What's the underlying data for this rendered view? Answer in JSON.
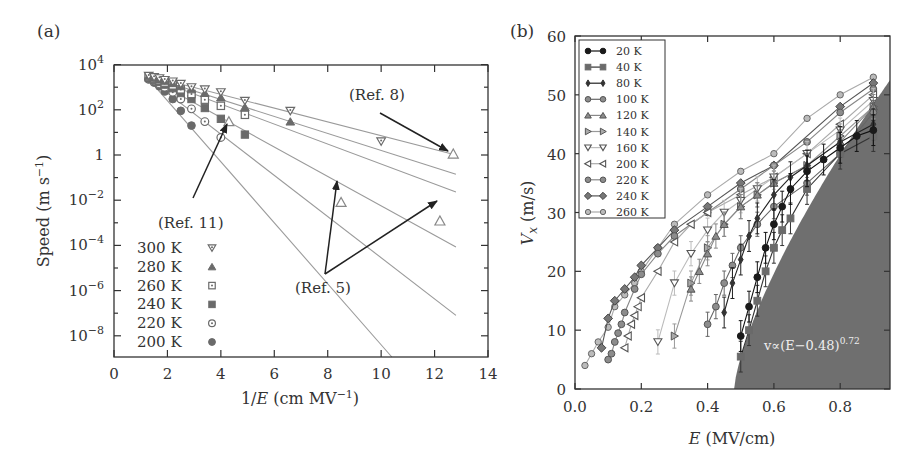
{
  "chart_data": [
    {
      "panel": "(a)",
      "type": "scatter",
      "title": "",
      "xlabel": "1/E (cm MV⁻¹)",
      "ylabel": "Speed (m s⁻¹)",
      "xlim": [
        0,
        14
      ],
      "ylim_log10": [
        -9.3,
        4
      ],
      "yscale": "log",
      "xticks": [
        0,
        2,
        4,
        6,
        8,
        10,
        12,
        14
      ],
      "yticks": [
        "10^4",
        "10^2",
        "1",
        "10^-2",
        "10^-4",
        "10^-6",
        "10^-8"
      ],
      "legend_position": "lower-left",
      "grid": false,
      "series": [
        {
          "name": "300 K",
          "marker": "triangle-down-open-dot",
          "x": [
            1.3,
            1.5,
            1.7,
            1.9,
            2.2,
            2.5,
            2.9,
            3.4,
            4.0,
            4.9,
            6.6,
            10.0
          ],
          "y": [
            3200,
            2800,
            2500,
            2100,
            1800,
            1400,
            1000,
            800,
            600,
            250,
            90,
            4
          ],
          "fit_end": [
            12.8,
            1.0
          ]
        },
        {
          "name": "280 K",
          "marker": "triangle-up-filled",
          "x": [
            1.3,
            1.5,
            1.7,
            1.9,
            2.2,
            2.5,
            2.9,
            3.4,
            4.0,
            4.9,
            6.6
          ],
          "y": [
            3000,
            2600,
            2200,
            1900,
            1500,
            1100,
            800,
            550,
            350,
            130,
            30
          ],
          "fit_end": [
            12.8,
            0.14
          ]
        },
        {
          "name": "260 K",
          "marker": "square-open-dot",
          "x": [
            1.3,
            1.5,
            1.7,
            1.9,
            2.2,
            2.5,
            2.9,
            3.4,
            4.0,
            4.9
          ],
          "y": [
            2800,
            2400,
            2000,
            1600,
            1200,
            800,
            500,
            280,
            150,
            60
          ],
          "fit_end": [
            12.8,
            0.023
          ]
        },
        {
          "name": "240 K",
          "marker": "square-filled",
          "x": [
            1.3,
            1.5,
            1.7,
            1.9,
            2.2,
            2.5,
            2.9,
            3.4,
            4.0,
            4.9
          ],
          "y": [
            2600,
            2100,
            1700,
            1300,
            900,
            550,
            300,
            120,
            40,
            8
          ],
          "fit_end": [
            12.8,
            8.5e-05
          ]
        },
        {
          "name": "220 K",
          "marker": "circle-open-dot",
          "x": [
            1.3,
            1.5,
            1.7,
            1.9,
            2.2,
            2.5,
            2.9,
            3.4,
            4.0
          ],
          "y": [
            2400,
            1900,
            1400,
            1000,
            600,
            300,
            110,
            30,
            6
          ],
          "fit_end": [
            12.8,
            8e-08
          ]
        },
        {
          "name": "200 K",
          "marker": "circle-filled",
          "x": [
            1.3,
            1.5,
            1.7,
            1.9,
            2.2,
            2.5,
            2.9
          ],
          "y": [
            2200,
            1600,
            1100,
            650,
            300,
            90,
            20
          ],
          "fit_end": [
            10.4,
            1.1e-09
          ]
        }
      ],
      "reference_points": [
        {
          "ref": "(Ref. 11)",
          "x": 4.3,
          "y": 30
        },
        {
          "ref": "(Ref. 5)",
          "x": 8.5,
          "y": 0.008
        },
        {
          "ref": "(Ref. 5)",
          "x": 12.2,
          "y": 0.0012
        },
        {
          "ref": "(Ref. 8)",
          "x": 12.7,
          "y": 1.1
        }
      ],
      "annotations": [
        "(Ref. 8)",
        "(Ref. 11)",
        "(Ref. 5)"
      ]
    },
    {
      "panel": "(b)",
      "type": "line",
      "title": "",
      "xlabel": "E (MV/cm)",
      "ylabel": "V_x (m/s)",
      "xlim": [
        0.0,
        0.95
      ],
      "ylim": [
        0,
        60
      ],
      "xticks": [
        0.0,
        0.2,
        0.4,
        0.6,
        0.8
      ],
      "yticks": [
        0,
        10,
        20,
        30,
        40,
        50,
        60
      ],
      "legend_position": "upper-left",
      "grid": false,
      "shaded_region": {
        "label": "v∝(E−0.48)^0.72",
        "E0": 0.48,
        "exponent": 0.72,
        "top_at_xmax": 52.5
      },
      "series": [
        {
          "name": "20 K",
          "marker": "circle-filled-black",
          "x": [
            0.5,
            0.525,
            0.55,
            0.575,
            0.6,
            0.625,
            0.65,
            0.7,
            0.75,
            0.8,
            0.85,
            0.9
          ],
          "y": [
            9,
            14,
            19,
            24,
            28,
            31,
            34,
            37,
            39,
            41,
            43,
            44
          ]
        },
        {
          "name": "40 K",
          "marker": "square-filled",
          "x": [
            0.5,
            0.525,
            0.55,
            0.575,
            0.6,
            0.625,
            0.65,
            0.7,
            0.8,
            0.9
          ],
          "y": [
            5.5,
            10,
            15,
            20,
            24,
            27,
            29,
            34,
            40,
            43
          ]
        },
        {
          "name": "80 K",
          "marker": "diamond-filled",
          "x": [
            0.45,
            0.475,
            0.5,
            0.525,
            0.55,
            0.6,
            0.65,
            0.7,
            0.8,
            0.9
          ],
          "y": [
            13,
            18,
            22,
            26,
            29,
            33,
            36,
            38,
            42,
            45
          ]
        },
        {
          "name": "100 K",
          "marker": "circle-grey",
          "x": [
            0.4,
            0.425,
            0.45,
            0.475,
            0.5,
            0.55,
            0.6,
            0.7,
            0.8,
            0.9
          ],
          "y": [
            11,
            14,
            18,
            21,
            24,
            28,
            31,
            35,
            40,
            47
          ]
        },
        {
          "name": "120 K",
          "marker": "triangle-up-grey",
          "x": [
            0.35,
            0.375,
            0.4,
            0.425,
            0.45,
            0.5,
            0.55,
            0.6,
            0.7,
            0.8,
            0.9
          ],
          "y": [
            17,
            20,
            23,
            26,
            28,
            31,
            33,
            35,
            38,
            42,
            48
          ]
        },
        {
          "name": "140 K",
          "marker": "triangle-right-grey",
          "x": [
            0.3,
            0.35,
            0.4,
            0.45,
            0.5,
            0.55,
            0.6,
            0.7,
            0.8,
            0.9
          ],
          "y": [
            9,
            18,
            24,
            28,
            31,
            33,
            35,
            38,
            43,
            48
          ]
        },
        {
          "name": "160 K",
          "marker": "triangle-down-open",
          "x": [
            0.25,
            0.3,
            0.35,
            0.4,
            0.45,
            0.5,
            0.55,
            0.6,
            0.7,
            0.8,
            0.9
          ],
          "y": [
            8,
            18,
            23,
            27,
            30,
            32,
            34,
            36,
            40,
            44,
            49
          ]
        },
        {
          "name": "200 K",
          "marker": "triangle-left-open",
          "x": [
            0.15,
            0.16,
            0.17,
            0.18,
            0.19,
            0.2,
            0.25,
            0.3,
            0.35,
            0.4,
            0.5,
            0.6,
            0.7,
            0.8,
            0.9
          ],
          "y": [
            7,
            9,
            11,
            12.5,
            14,
            15.5,
            20,
            25,
            28,
            30,
            33,
            36,
            40,
            45,
            50
          ]
        },
        {
          "name": "220 K",
          "marker": "circle-grey-2",
          "x": [
            0.1,
            0.11,
            0.12,
            0.13,
            0.14,
            0.15,
            0.18,
            0.2,
            0.25,
            0.3,
            0.4,
            0.5,
            0.6,
            0.7,
            0.8,
            0.9
          ],
          "y": [
            5,
            6,
            8,
            9.5,
            11,
            13,
            17,
            19.5,
            23,
            26,
            30,
            34,
            38,
            42,
            47,
            51
          ]
        },
        {
          "name": "240 K",
          "marker": "diamond-grey",
          "x": [
            0.08,
            0.1,
            0.12,
            0.15,
            0.18,
            0.2,
            0.25,
            0.3,
            0.4,
            0.5,
            0.6,
            0.8,
            0.9
          ],
          "y": [
            7,
            12,
            15,
            17,
            19,
            21,
            24,
            27,
            31,
            35,
            38,
            48,
            52
          ]
        },
        {
          "name": "260 K",
          "marker": "circle-open-small",
          "x": [
            0.03,
            0.05,
            0.07,
            0.1,
            0.12,
            0.15,
            0.18,
            0.2,
            0.25,
            0.3,
            0.4,
            0.5,
            0.6,
            0.7,
            0.8,
            0.9
          ],
          "y": [
            4,
            6,
            8,
            10.5,
            14,
            16,
            18,
            20,
            24,
            28,
            33,
            37,
            40,
            46,
            50,
            53
          ]
        }
      ]
    }
  ],
  "panel_a": {
    "label": "(a)",
    "xlabel_prefix": "1/",
    "xlabel_var": "E",
    "xlabel_suffix": " (cm MV",
    "xlabel_sup": "−1",
    "xlabel_close": ")",
    "ylabel": "Speed (m s",
    "ylabel_sup": "−1",
    "ylabel_close": ")",
    "xtick_labels": [
      "0",
      "2",
      "4",
      "6",
      "8",
      "10",
      "12",
      "14"
    ],
    "ytick_labels": [
      {
        "base": "10",
        "exp": "4"
      },
      {
        "base": "10",
        "exp": "2"
      },
      {
        "base": "1",
        "exp": ""
      },
      {
        "base": "10",
        "exp": "−2"
      },
      {
        "base": "10",
        "exp": "−4"
      },
      {
        "base": "10",
        "exp": "−6"
      },
      {
        "base": "10",
        "exp": "−8"
      }
    ],
    "legend": [
      "300 K",
      "280 K",
      "260 K",
      "240 K",
      "220 K",
      "200 K"
    ],
    "annotations": {
      "ref8": "(Ref. 8)",
      "ref11": "(Ref. 11)",
      "ref5": "(Ref. 5)"
    }
  },
  "panel_b": {
    "label": "(b)",
    "xlabel_var": "E",
    "xlabel_suffix": " (MV/cm)",
    "ylabel_var": "V",
    "ylabel_sub": "x",
    "ylabel_suffix": " (m/s)",
    "xtick_labels": [
      "0.0",
      "0.2",
      "0.4",
      "0.6",
      "0.8"
    ],
    "ytick_labels": [
      "0",
      "10",
      "20",
      "30",
      "40",
      "50",
      "60"
    ],
    "legend": [
      "20 K",
      "40 K",
      "80 K",
      "100 K",
      "120 K",
      "140 K",
      "160 K",
      "200 K",
      "220 K",
      "240 K",
      "260 K"
    ],
    "formula_main": "v∝(E−0.48)",
    "formula_exp": "0.72"
  },
  "colors": {
    "axis": "#333333",
    "fit_line": "#9a9a9a",
    "arrow": "#222222",
    "shade": "#6f6f6f",
    "marker_dark": "#111111",
    "marker_mid": "#6a6a6a",
    "marker_light": "#8a8a8a"
  }
}
